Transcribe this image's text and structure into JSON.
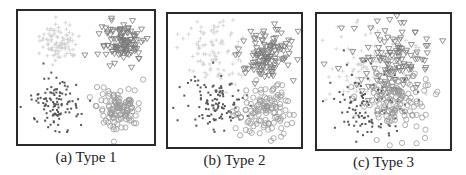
{
  "figure": {
    "panels": [
      {
        "id": "a",
        "caption": "(a) Type 1"
      },
      {
        "id": "b",
        "caption": "(b) Type 2"
      },
      {
        "id": "c",
        "caption": "(c) Type 3"
      }
    ]
  },
  "chart_data": [
    {
      "type": "scatter",
      "title": "(a) Type 1",
      "xlabel": "",
      "ylabel": "",
      "axes_visible": false,
      "grid": false,
      "legend": "none",
      "series": [
        {
          "name": "class-1 (light, upper-left)",
          "marker": "cross-faint",
          "color": "#cfcfcf",
          "center": [
            0.3,
            0.23
          ],
          "spread": 0.07,
          "n": 90
        },
        {
          "name": "class-2 (triangle-down, upper-right)",
          "marker": "triangle-down",
          "color": "#7a7a7a",
          "center": [
            0.77,
            0.24
          ],
          "spread": 0.08,
          "n": 110
        },
        {
          "name": "class-3 (dots, lower-left)",
          "marker": "dot",
          "color": "#555555",
          "center": [
            0.28,
            0.7
          ],
          "spread": 0.09,
          "n": 110
        },
        {
          "name": "class-4 (open circle, lower-right)",
          "marker": "circle",
          "color": "#9a9a9a",
          "center": [
            0.74,
            0.72
          ],
          "spread": 0.08,
          "n": 110
        }
      ]
    },
    {
      "type": "scatter",
      "title": "(b) Type 2",
      "xlabel": "",
      "ylabel": "",
      "axes_visible": false,
      "grid": false,
      "legend": "none",
      "series": [
        {
          "name": "class-1 (light, upper-left)",
          "marker": "cross-faint",
          "color": "#d2d2d2",
          "center": [
            0.36,
            0.28
          ],
          "spread": 0.13,
          "n": 100
        },
        {
          "name": "class-2 (triangle-down, upper-right)",
          "marker": "triangle-down",
          "color": "#7a7a7a",
          "center": [
            0.74,
            0.3
          ],
          "spread": 0.1,
          "n": 120
        },
        {
          "name": "class-3 (dots, lower-left)",
          "marker": "dot",
          "color": "#555555",
          "center": [
            0.36,
            0.68
          ],
          "spread": 0.11,
          "n": 110
        },
        {
          "name": "class-4 (open circle, lower-right)",
          "marker": "circle",
          "color": "#9a9a9a",
          "center": [
            0.71,
            0.72
          ],
          "spread": 0.1,
          "n": 120
        }
      ]
    },
    {
      "type": "scatter",
      "title": "(c) Type 3",
      "xlabel": "",
      "ylabel": "",
      "axes_visible": false,
      "grid": false,
      "legend": "none",
      "series": [
        {
          "name": "class-1 (light, upper-left)",
          "marker": "cross-faint",
          "color": "#d2d2d2",
          "center": [
            0.4,
            0.4
          ],
          "spread": 0.16,
          "n": 110
        },
        {
          "name": "class-2 (triangle-down, upper-right)",
          "marker": "triangle-down",
          "color": "#7a7a7a",
          "center": [
            0.58,
            0.35
          ],
          "spread": 0.14,
          "n": 130
        },
        {
          "name": "class-3 (dots, lower-left)",
          "marker": "dot",
          "color": "#555555",
          "center": [
            0.38,
            0.68
          ],
          "spread": 0.14,
          "n": 110
        },
        {
          "name": "class-4 (open circle, lower-right)",
          "marker": "circle",
          "color": "#9a9a9a",
          "center": [
            0.6,
            0.62
          ],
          "spread": 0.13,
          "n": 130
        }
      ]
    }
  ],
  "layout": {
    "frames": [
      {
        "x": 16,
        "y": 9,
        "w": 140,
        "h": 137
      },
      {
        "x": 166,
        "y": 12,
        "w": 137,
        "h": 137
      },
      {
        "x": 315,
        "y": 12,
        "w": 137,
        "h": 139
      }
    ],
    "captions_y": [
      149,
      152,
      154
    ]
  }
}
